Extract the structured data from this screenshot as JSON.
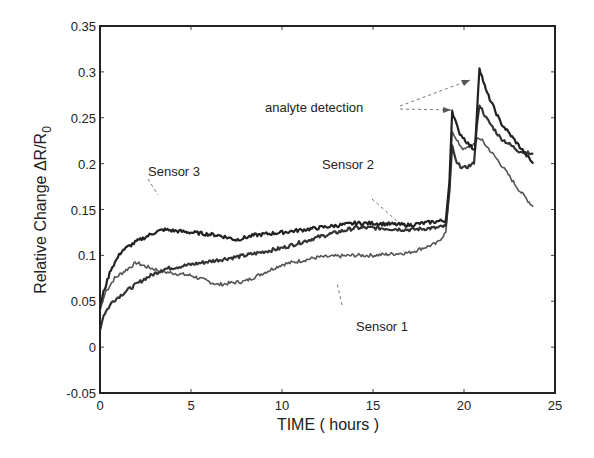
{
  "chart_data": {
    "type": "line",
    "title": "",
    "xlabel": "TIME ( hours )",
    "ylabel": "Relative Change  ΔR/R",
    "ylabel_subscript": "0",
    "xlim": [
      0,
      25
    ],
    "ylim": [
      -0.05,
      0.35
    ],
    "xticks": [
      0,
      5,
      10,
      15,
      20,
      25
    ],
    "xtick_labels": [
      "0",
      "5",
      "10",
      "15",
      "20",
      "25"
    ],
    "yticks": [
      -0.05,
      0,
      0.05,
      0.1,
      0.15,
      0.2,
      0.25,
      0.3,
      0.35
    ],
    "ytick_labels": [
      "-0.05",
      "0",
      "0.05",
      "0.1",
      "0.15",
      "0.2",
      "0.25",
      "0.3",
      "0.35"
    ],
    "grid": false,
    "legend": null,
    "series": [
      {
        "name": "Sensor 1",
        "color": "#555555",
        "x": [
          0,
          0.3,
          0.8,
          1.5,
          2.0,
          2.5,
          3.5,
          5,
          6.5,
          8,
          10,
          12,
          14,
          15,
          17,
          18.5,
          19.0,
          19.2,
          19.35,
          19.6,
          20,
          20.6,
          20.75,
          21,
          22,
          23,
          23.8
        ],
        "y": [
          0.04,
          0.06,
          0.075,
          0.085,
          0.092,
          0.088,
          0.082,
          0.078,
          0.068,
          0.072,
          0.09,
          0.098,
          0.1,
          0.1,
          0.103,
          0.113,
          0.125,
          0.17,
          0.235,
          0.225,
          0.215,
          0.222,
          0.228,
          0.225,
          0.2,
          0.172,
          0.153
        ]
      },
      {
        "name": "Sensor 2",
        "color": "#333333",
        "x": [
          0,
          0.2,
          0.7,
          1.5,
          2.5,
          3.5,
          5,
          6.5,
          8,
          10,
          12,
          14,
          15,
          17,
          18.5,
          19.0,
          19.2,
          19.35,
          19.6,
          20,
          20.55,
          20.7,
          20.85,
          21.2,
          22,
          23,
          23.8
        ],
        "y": [
          0.018,
          0.035,
          0.05,
          0.062,
          0.075,
          0.085,
          0.09,
          0.095,
          0.1,
          0.108,
          0.12,
          0.13,
          0.13,
          0.128,
          0.13,
          0.132,
          0.17,
          0.22,
          0.2,
          0.195,
          0.2,
          0.24,
          0.265,
          0.25,
          0.228,
          0.214,
          0.21
        ]
      },
      {
        "name": "Sensor 3",
        "color": "#222222",
        "x": [
          0,
          0.2,
          0.6,
          1.2,
          2.0,
          3.0,
          3.5,
          5,
          6.5,
          7.5,
          8.5,
          10,
          12,
          14,
          15,
          17,
          18.5,
          19.0,
          19.2,
          19.35,
          19.7,
          20.3,
          20.6,
          20.85,
          21.2,
          22,
          23,
          23.8
        ],
        "y": [
          0.045,
          0.06,
          0.085,
          0.105,
          0.115,
          0.125,
          0.128,
          0.125,
          0.122,
          0.117,
          0.122,
          0.125,
          0.13,
          0.135,
          0.135,
          0.133,
          0.137,
          0.138,
          0.18,
          0.258,
          0.235,
          0.22,
          0.215,
          0.305,
          0.28,
          0.245,
          0.22,
          0.2
        ]
      }
    ],
    "annotations": [
      {
        "text": "Sensor 3",
        "x": 1.1,
        "y": 0.167
      },
      {
        "text": "Sensor 2",
        "x": 10.9,
        "y": 0.172
      },
      {
        "text": "Sensor 1",
        "x": 12.1,
        "y": 0.044
      },
      {
        "text": "analyte detection",
        "x": 7.5,
        "y": 0.256
      }
    ]
  },
  "labels": {
    "sensor1": "Sensor 1",
    "sensor2": "Sensor 2",
    "sensor3": "Sensor 3",
    "analyte": "analyte detection",
    "xlabel": "TIME ( hours )",
    "ylabel_main": "Relative Change  ΔR/R",
    "ylabel_sub": "0"
  }
}
